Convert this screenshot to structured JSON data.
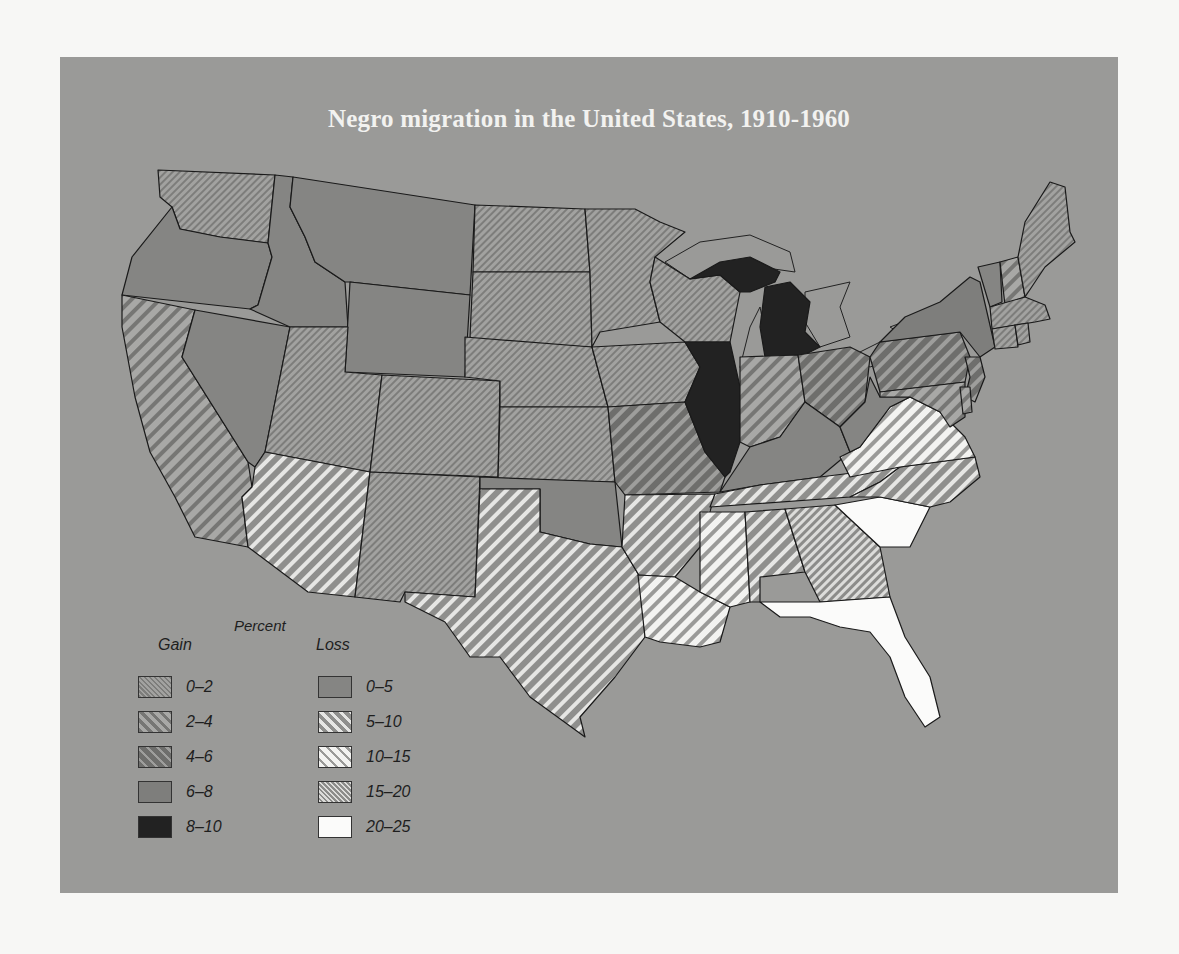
{
  "title": "Negro migration in the United States, 1910-1960",
  "legend": {
    "heading": "Percent",
    "gain_heading": "Gain",
    "loss_heading": "Loss",
    "gain": [
      {
        "label": "0–2",
        "pattern": "gain-0-2"
      },
      {
        "label": "2–4",
        "pattern": "gain-2-4"
      },
      {
        "label": "4–6",
        "pattern": "gain-4-6"
      },
      {
        "label": "6–8",
        "pattern": "gain-6-8"
      },
      {
        "label": "8–10",
        "pattern": "gain-8-10"
      }
    ],
    "loss": [
      {
        "label": "0–5",
        "pattern": "loss-0-5"
      },
      {
        "label": "5–10",
        "pattern": "loss-5-10"
      },
      {
        "label": "10–15",
        "pattern": "loss-10-15"
      },
      {
        "label": "15–20",
        "pattern": "loss-15-20"
      },
      {
        "label": "20–25",
        "pattern": "loss-20-25"
      }
    ]
  },
  "colors": {
    "background": "#9a9a98",
    "page": "#f7f7f5",
    "title": "#f2f2f0",
    "solid_gain_6_8": "#7e7e7c",
    "solid_gain_8_10": "#222222",
    "solid_loss_0_5": "#858583",
    "loss_20_25": "#fbfbfa"
  },
  "states": {
    "WA": "gain-0-2",
    "OR": "loss-0-5",
    "CA": "gain-2-4",
    "NV": "loss-0-5",
    "ID": "loss-0-5",
    "MT": "loss-0-5",
    "WY": "loss-0-5",
    "UT": "gain-0-2",
    "AZ": "loss-5-10",
    "CO": "gain-0-2",
    "NM": "gain-0-2",
    "ND": "gain-0-2",
    "SD": "gain-0-2",
    "NE": "gain-0-2",
    "KS": "gain-0-2",
    "OK": "loss-0-5",
    "TX": "loss-5-10",
    "MN": "gain-0-2",
    "IA": "gain-0-2",
    "MO": "gain-4-6",
    "AR": "loss-5-10",
    "LA": "loss-10-15",
    "WI": "gain-0-2",
    "IL": "gain-8-10",
    "MI": "gain-8-10",
    "IN": "gain-2-4",
    "OH": "gain-4-6",
    "KY": "loss-0-5",
    "TN": "loss-5-10",
    "MS": "loss-10-15",
    "AL": "loss-5-10",
    "GA": "loss-15-20",
    "FL": "loss-20-25",
    "SC": "loss-20-25",
    "NC": "loss-5-10",
    "VA": "loss-10-15",
    "WV": "loss-0-5",
    "PA": "gain-4-6",
    "NY": "gain-6-8",
    "NJ": "gain-4-6",
    "MD": "gain-2-4",
    "DE": "gain-2-4",
    "CT": "gain-0-2",
    "RI": "gain-0-2",
    "MA": "gain-0-2",
    "VT": "loss-0-5",
    "NH": "gain-2-4",
    "ME": "gain-0-2"
  }
}
